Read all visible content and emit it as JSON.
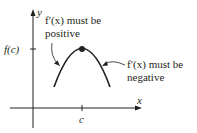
{
  "diagram": {
    "axes": {
      "x_label": "x",
      "y_label": "y"
    },
    "ticks": {
      "x_tick_label": "c",
      "y_tick_label": "f(c)"
    },
    "annotations": {
      "left": {
        "line1": "f′(x) must be",
        "line2": "positive"
      },
      "right": {
        "line1": "f′(x) must be",
        "line2": "negative"
      }
    },
    "curve": {
      "shape": "downward-opening parabola",
      "maximum_point": "(c, f(c))"
    },
    "colors": {
      "ink": "#231f20",
      "background": "#ffffff"
    }
  }
}
